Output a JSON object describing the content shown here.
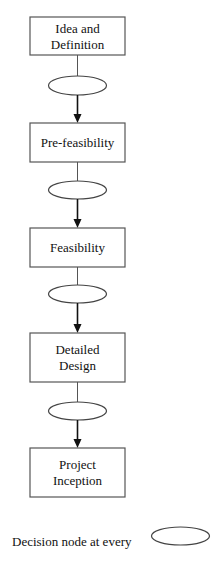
{
  "diagram": {
    "type": "flowchart",
    "direction": "top-to-bottom",
    "stages": [
      {
        "lines": [
          "Idea and",
          "Definition"
        ]
      },
      {
        "lines": [
          "Pre-feasibility"
        ]
      },
      {
        "lines": [
          "Feasibility"
        ]
      },
      {
        "lines": [
          "Detailed",
          "Design"
        ]
      },
      {
        "lines": [
          "Project",
          "Inception"
        ]
      }
    ],
    "decision_nodes": 4,
    "legend": {
      "text": "Decision node at every",
      "symbol": "ellipse"
    }
  }
}
